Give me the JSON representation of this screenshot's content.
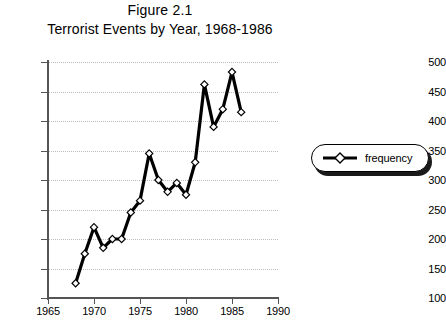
{
  "figure": {
    "label": "Figure 2.1",
    "title": "Terrorist Events by Year, 1968-1986"
  },
  "legend": {
    "position": "right",
    "entries": [
      {
        "name": "frequency",
        "marker": "diamond-line-marker"
      }
    ]
  },
  "axes": {
    "y_ticks": [
      "100",
      "150",
      "200",
      "250",
      "300",
      "350",
      "400",
      "450",
      "500"
    ],
    "x_ticks": [
      "1965",
      "1970",
      "1975",
      "1980",
      "1985",
      "1990"
    ]
  },
  "colors": {
    "series_line": "#000000",
    "marker_fill": "#ffffff",
    "axis": "#555555",
    "grid": "#bdbdbd",
    "background": "#ffffff"
  },
  "chart_data": {
    "type": "line",
    "title": "Terrorist Events by Year, 1968-1986",
    "subtitle": "Figure 2.1",
    "xlabel": "",
    "ylabel": "",
    "xlim": [
      1965,
      1990
    ],
    "ylim": [
      100,
      500
    ],
    "xticks": [
      1965,
      1970,
      1975,
      1980,
      1985,
      1990
    ],
    "yticks": [
      100,
      150,
      200,
      250,
      300,
      350,
      400,
      450,
      500
    ],
    "grid": true,
    "grid_axis": "y",
    "legend": "right",
    "x": [
      1968,
      1969,
      1970,
      1971,
      1972,
      1973,
      1974,
      1975,
      1976,
      1977,
      1978,
      1979,
      1980,
      1981,
      1982,
      1983,
      1984,
      1985,
      1986
    ],
    "series": [
      {
        "name": "frequency",
        "marker": "diamond",
        "values": [
          125,
          175,
          220,
          185,
          200,
          200,
          245,
          265,
          345,
          300,
          280,
          295,
          275,
          330,
          462,
          390,
          420,
          483,
          415
        ]
      }
    ]
  }
}
